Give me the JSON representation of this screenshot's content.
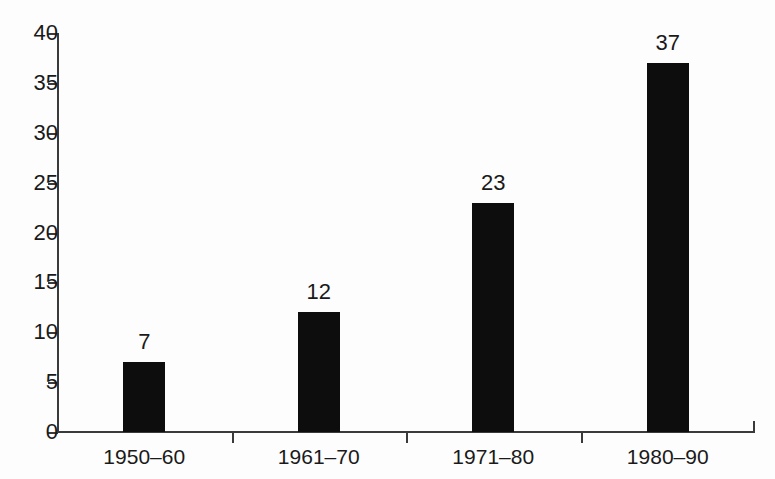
{
  "chart_data": {
    "type": "bar",
    "title": "",
    "subtitle": "",
    "xlabel": "",
    "ylabel": "",
    "categories": [
      "1950–60",
      "1961–70",
      "1971–80",
      "1980–90"
    ],
    "values": [
      7,
      12,
      23,
      37
    ],
    "value_labels": [
      "7",
      "12",
      "23",
      "37"
    ],
    "ylim": [
      0,
      40
    ],
    "y_ticks": [
      0,
      5,
      10,
      15,
      20,
      25,
      30,
      35,
      40
    ],
    "y_tick_labels": [
      "0",
      "5",
      "10",
      "15",
      "20",
      "25",
      "30",
      "35",
      "40"
    ],
    "grid": false,
    "legend": null,
    "legend_position": "none",
    "bar_color": "#0d0d0d",
    "axis_color": "#3a3a3a",
    "background_color": "#fdfdfd",
    "annotations": []
  }
}
